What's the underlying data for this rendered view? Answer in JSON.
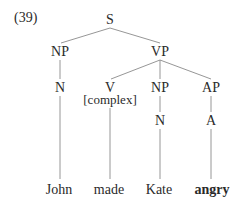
{
  "example_number": "(39)",
  "tree": {
    "root": "S",
    "nodes": {
      "s": "S",
      "np_subject": "NP",
      "vp": "VP",
      "n_subject": "N",
      "v": "V",
      "v_feature": "[complex]",
      "np_object": "NP",
      "ap": "AP",
      "n_object": "N",
      "a": "A"
    },
    "leaves": {
      "john": "John",
      "made": "made",
      "kate": "Kate",
      "angry": "angry"
    },
    "structure": "[S [NP [N John]] [VP [V[complex] made] [NP [N Kate]] [AP [A angry]]]]",
    "emphasized_leaf": "angry"
  }
}
